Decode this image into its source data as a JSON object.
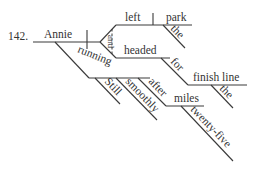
{
  "exercise_number": "142.",
  "words": {
    "subject": "Annie",
    "verb1": "left",
    "object1": "park",
    "object1_modifier": "the",
    "conjunction": "and",
    "verb2": "headed",
    "preposition1": "for",
    "prep_object1": "finish line",
    "prep_object1_modifier": "the",
    "participle": "running",
    "participle_modifier1": "Still",
    "participle_modifier2": "smoothly",
    "preposition2": "after",
    "prep_object2": "miles",
    "prep_object2_modifier": "twenty-five"
  },
  "colors": {
    "line": "#3a3a3a",
    "text": "#333333",
    "background": "#ffffff"
  }
}
